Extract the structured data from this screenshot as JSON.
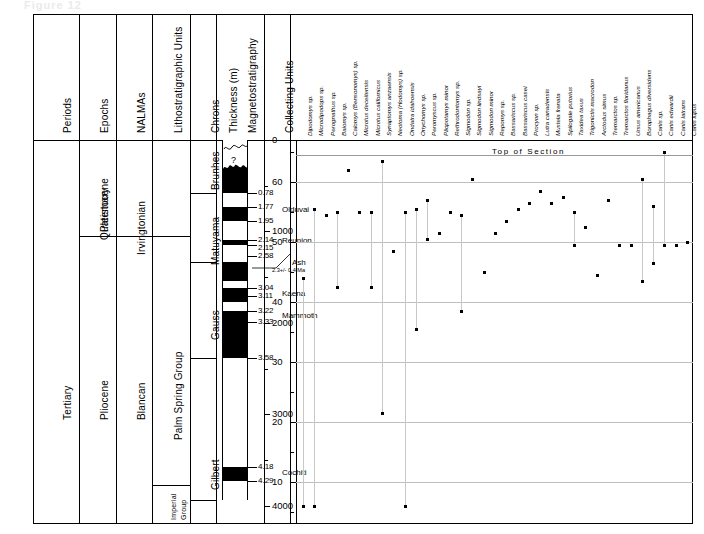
{
  "figure": {
    "faint_top_text": "Figure 12",
    "annotation_top_of_section": "Top of Section"
  },
  "columns": {
    "headers": [
      {
        "key": "periods",
        "label": "Periods"
      },
      {
        "key": "epochs",
        "label": "Epochs"
      },
      {
        "key": "nalmas",
        "label": "NALMAs"
      },
      {
        "key": "litho",
        "label": "Lithostratigraphic Units"
      },
      {
        "key": "chrons",
        "label": "Chrons"
      },
      {
        "key": "magneto",
        "label": "Magnetostratigraphy"
      },
      {
        "key": "thickness",
        "label": "Thickness (m)"
      },
      {
        "key": "collecting",
        "label": "Collecting Units"
      }
    ]
  },
  "periods": [
    {
      "label": "Tertiary"
    }
  ],
  "epochs": [
    {
      "label": "Quaternary"
    },
    {
      "label": "Pleistocene"
    },
    {
      "label": "Pliocene"
    }
  ],
  "nalmas": [
    {
      "label": "Irvingtonian"
    },
    {
      "label": "Blancan"
    }
  ],
  "litho": [
    {
      "label": "Palm  Spring  Group"
    },
    {
      "label": "Imperial"
    },
    {
      "label": "Group"
    }
  ],
  "chrons": [
    {
      "label": "Brunhes"
    },
    {
      "label": "Matuyama"
    },
    {
      "label": "Gauss"
    },
    {
      "label": "Gilbert"
    }
  ],
  "magnetostratigraphy": {
    "question_mark": "?",
    "age_labels": [
      {
        "value": "0.78"
      },
      {
        "value": "1.77"
      },
      {
        "value": "1.95"
      },
      {
        "value": "2.14"
      },
      {
        "value": "2.15"
      },
      {
        "value": "2.58"
      },
      {
        "value": "3.04"
      },
      {
        "value": "3.11"
      },
      {
        "value": "3.22"
      },
      {
        "value": "3.33"
      },
      {
        "value": "3.58"
      },
      {
        "value": "4.18"
      },
      {
        "value": "4.29"
      }
    ],
    "subchrons": [
      {
        "label": "Olduvai"
      },
      {
        "label": "Reunion"
      },
      {
        "label": "Kaena"
      },
      {
        "label": "Mammoth"
      },
      {
        "label": "Cochiti"
      }
    ],
    "ash": {
      "label": "Ash",
      "age": "2.3+/- 0.4 Ma"
    }
  },
  "chart_data": {
    "type": "scatter",
    "title": "Top of Section",
    "xlabel": "",
    "ylabel_left": "Thickness (m)",
    "ylabel_right": "Collecting Units",
    "grid": true,
    "legend": "none",
    "thickness_axis": {
      "label": "Thickness (m)",
      "ticks": [
        0,
        1000,
        2000,
        3000,
        4000
      ],
      "minor_ticks": [
        500,
        1500,
        2500,
        3500
      ],
      "range": [
        0,
        4200
      ]
    },
    "collecting_units_axis": {
      "label": "Collecting Units",
      "ticks": [
        60,
        50,
        40,
        30,
        20,
        10
      ],
      "minor_ticks": [
        65,
        55,
        45,
        35,
        25,
        15,
        5
      ],
      "range": [
        67,
        3
      ]
    },
    "categories": [
      "Dipodomys sp.",
      "Microdipodops sp.",
      "Perognathus sp.",
      "Baiomys sp.",
      "Calomys (Bensonomys) sp.",
      "Microtus deceitensis",
      "Microtus californicus",
      "Synaptomys anzaensis",
      "Neotoma (Hodomys) sp.",
      "Ondatra idahoensis",
      "Onychomys sp.",
      "Peromyscus sp.",
      "Pliopotamys minor",
      "Rethrodontomys sp.",
      "Sigmodon sp.",
      "Sigmodon lindsayi",
      "Sigmodon minor",
      "Repomys sp.",
      "Bassariscus sp.",
      "Bassariscus casei",
      "Procyon sp.",
      "Lutra canadensis",
      "Mustela frenata",
      "Spilogale putorius",
      "Taxidea taxus",
      "Trigonictis macrodon",
      "Arctodus simus",
      "Tremarctos sp.",
      "Tremarctos floridanus",
      "Ursus americanus",
      "Borophagus diversidens",
      "Canis sp.",
      "Canis edwardii",
      "Canis latrans",
      "Canis lupus"
    ],
    "series": [
      {
        "name": "Stratigraphic range (collecting units)",
        "ranges": [
          {
            "category": "Dipodomys sp.",
            "top": 44.0,
            "bottom": 6.0
          },
          {
            "category": "Microdipodops sp.",
            "top": 55.5,
            "bottom": 6.0
          },
          {
            "category": "Perognathus sp.",
            "top": 54.5,
            "bottom": 54.5
          },
          {
            "category": "Baiomys sp.",
            "top": 55.0,
            "bottom": 42.5
          },
          {
            "category": "Calomys (Bensonomys) sp.",
            "top": 62.0,
            "bottom": 62.0
          },
          {
            "category": "Microtus deceitensis",
            "top": 55.0,
            "bottom": 55.0
          },
          {
            "category": "Microtus californicus",
            "top": 55.0,
            "bottom": 42.5
          },
          {
            "category": "Synaptomys anzaensis",
            "top": 63.5,
            "bottom": 21.5
          },
          {
            "category": "Neotoma (Hodomys) sp.",
            "top": 48.5,
            "bottom": 48.5
          },
          {
            "category": "Ondatra idahoensis",
            "top": 55.0,
            "bottom": 6.0
          },
          {
            "category": "Onychomys sp.",
            "top": 55.5,
            "bottom": 35.5
          },
          {
            "category": "Peromyscus sp.",
            "top": 57.0,
            "bottom": 50.5
          },
          {
            "category": "Pliopotamys minor",
            "top": 51.5,
            "bottom": 51.5
          },
          {
            "category": "Rethrodontomys sp.",
            "top": 55.0,
            "bottom": 55.0
          },
          {
            "category": "Sigmodon sp.",
            "top": 54.5,
            "bottom": 38.5
          },
          {
            "category": "Sigmodon lindsayi",
            "top": 60.5,
            "bottom": 60.5
          },
          {
            "category": "Sigmodon minor",
            "top": 45.0,
            "bottom": 45.0
          },
          {
            "category": "Repomys sp.",
            "top": 51.5,
            "bottom": 51.5
          },
          {
            "category": "Bassariscus sp.",
            "top": 53.5,
            "bottom": 53.5
          },
          {
            "category": "Bassariscus casei",
            "top": 55.5,
            "bottom": 55.5
          },
          {
            "category": "Procyon sp.",
            "top": 56.5,
            "bottom": 56.5
          },
          {
            "category": "Lutra canadensis",
            "top": 58.5,
            "bottom": 58.5
          },
          {
            "category": "Mustela frenata",
            "top": 56.5,
            "bottom": 56.5
          },
          {
            "category": "Spilogale putorius",
            "top": 57.5,
            "bottom": 57.5
          },
          {
            "category": "Taxidea taxus",
            "top": 55.0,
            "bottom": 49.5
          },
          {
            "category": "Trigonictis macrodon",
            "top": 52.5,
            "bottom": 52.5
          },
          {
            "category": "Arctodus simus",
            "top": 44.5,
            "bottom": 44.5
          },
          {
            "category": "Tremarctos sp.",
            "top": 57.0,
            "bottom": 57.0
          },
          {
            "category": "Tremarctos floridanus",
            "top": 49.5,
            "bottom": 49.5
          },
          {
            "category": "Ursus americanus",
            "top": 49.5,
            "bottom": 49.5
          },
          {
            "category": "Borophagus diversidens",
            "top": 60.5,
            "bottom": 43.5
          },
          {
            "category": "Canis sp.",
            "top": 56.0,
            "bottom": 46.5
          },
          {
            "category": "Canis edwardii",
            "top": 65.0,
            "bottom": 49.5
          },
          {
            "category": "Canis latrans",
            "top": 49.5,
            "bottom": 49.5
          },
          {
            "category": "Canis lupus",
            "top": 50.0,
            "bottom": 50.0
          }
        ]
      }
    ]
  }
}
